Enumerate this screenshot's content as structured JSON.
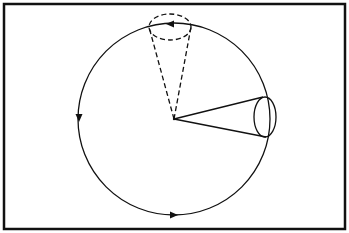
{
  "diagram": {
    "title": "",
    "colors": {
      "stroke": "#111111",
      "background": "#ffffff"
    },
    "frame": {
      "x": 4,
      "y": 4,
      "width": 341,
      "height": 225
    },
    "orbit": {
      "cx": 174,
      "cy": 119,
      "r": 96,
      "direction": "counterclockwise"
    },
    "arrows": [
      {
        "position": "top",
        "x": 170,
        "y": 24,
        "pointing": "left"
      },
      {
        "position": "left",
        "x": 79,
        "y": 118,
        "pointing": "down"
      },
      {
        "position": "bottom",
        "x": 174,
        "y": 215,
        "pointing": "right"
      }
    ],
    "cones": [
      {
        "style": "solid",
        "apex": [
          174,
          119
        ],
        "direction": "right",
        "ellipse": {
          "cx": 265,
          "cy": 117,
          "rx": 11,
          "ry": 20
        }
      },
      {
        "style": "dashed",
        "apex": [
          174,
          119
        ],
        "direction": "up",
        "ellipse": {
          "cx": 170,
          "cy": 27,
          "rx": 21,
          "ry": 13
        }
      }
    ]
  }
}
